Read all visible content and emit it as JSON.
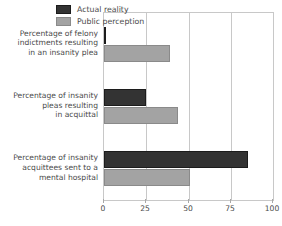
{
  "chart_data": {
    "type": "bar",
    "orientation": "horizontal",
    "title": "",
    "subtitle": "",
    "xlabel": "",
    "ylabel": "",
    "xlim": [
      0,
      100
    ],
    "xticks": [
      0,
      25,
      50,
      75,
      100
    ],
    "xtick_labels": [
      "0",
      "25",
      "50",
      "75",
      "100"
    ],
    "grid": true,
    "grid_axis": "x",
    "legend_position": "top-right",
    "categories": [
      "Percentage of felony indictments resulting in an insanity plea",
      "Percentage of insanity pleas resulting in acquittal",
      "Percentage of insanity acquittees sent to a mental hospital"
    ],
    "category_lines": [
      [
        "Percentage of felony",
        "indictments resulting",
        "in an insanity plea"
      ],
      [
        "Percentage of insanity",
        "pleas resulting",
        "in acquittal"
      ],
      [
        "Percentage of insanity",
        "acquittees sent to a",
        "mental hospital"
      ]
    ],
    "series": [
      {
        "name": "Actual reality",
        "color": "#333333",
        "values": [
          1,
          25,
          85
        ]
      },
      {
        "name": "Public perception",
        "color": "#a3a3a3",
        "values": [
          39,
          44,
          51
        ]
      }
    ]
  },
  "legend": {
    "items": [
      {
        "label": "Actual reality",
        "swatch": "dark"
      },
      {
        "label": "Public perception",
        "swatch": "light"
      }
    ]
  },
  "colors": {
    "actual_reality": "#333333",
    "public_perception": "#a3a3a3",
    "axis": "#c8c8c8",
    "text": "#4a4a4a",
    "background": "#ffffff"
  }
}
